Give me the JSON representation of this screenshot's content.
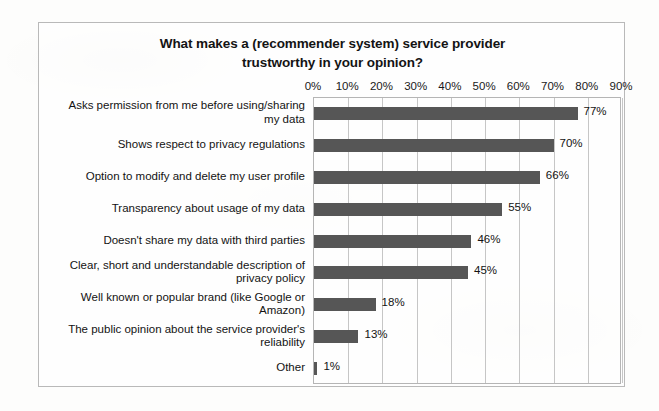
{
  "chart_data": {
    "type": "bar",
    "orientation": "horizontal",
    "title": "What makes a (recommender system) service provider trustworthy in your opinion?",
    "title_lines": [
      "What makes a (recommender system) service provider",
      "trustworthy in your opinion?"
    ],
    "xlabel": "",
    "ylabel": "",
    "xlim": [
      0,
      90
    ],
    "grid": true,
    "legend": false,
    "axis_position": "top",
    "tick_labels": [
      "0%",
      "10%",
      "20%",
      "30%",
      "40%",
      "50%",
      "60%",
      "70%",
      "80%",
      "90%"
    ],
    "tick_values": [
      0,
      10,
      20,
      30,
      40,
      50,
      60,
      70,
      80,
      90
    ],
    "bar_color": "#565656",
    "grid_color": "#c6c6c6",
    "frame_color": "#b9b9b9",
    "categories": [
      "Asks permission from me before using/sharing my data",
      "Shows respect to privacy regulations",
      "Option to modify and delete my user profile",
      "Transparency about usage of my data",
      "Doesn't share my data with third parties",
      "Clear, short and understandable description of privacy policy",
      "Well known or popular brand (like Google or Amazon)",
      "The public opinion about the service provider's reliability",
      "Other"
    ],
    "category_lines": [
      [
        "Asks permission from me before using/sharing",
        "my data"
      ],
      [
        "Shows respect to privacy regulations"
      ],
      [
        "Option to modify and delete my user profile"
      ],
      [
        "Transparency about usage of my data"
      ],
      [
        "Doesn't share my data with third parties"
      ],
      [
        "Clear, short and understandable description of",
        "privacy policy"
      ],
      [
        "Well known or popular brand (like Google or",
        "Amazon)"
      ],
      [
        "The public opinion about the service provider's",
        "reliability"
      ],
      [
        "Other"
      ]
    ],
    "values": [
      77,
      70,
      66,
      55,
      46,
      45,
      18,
      13,
      1
    ],
    "value_labels": [
      "77%",
      "70%",
      "66%",
      "55%",
      "46%",
      "45%",
      "18%",
      "13%",
      "1%"
    ]
  }
}
